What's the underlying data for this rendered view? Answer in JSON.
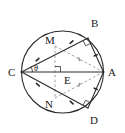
{
  "figure": {
    "kind": "circle-geometry-diagram",
    "background_color": "#ffffff",
    "stroke_color": "#2b2b2b",
    "dashed_stroke_color": "#8a8a8a",
    "label_color": "#1a1a1a",
    "width": 125,
    "height": 133
  },
  "circle": {
    "center_x": 62.5,
    "center_y": 72,
    "radius": 41,
    "stroke_width": 1.1
  },
  "points": [
    {
      "id": "A",
      "label": "A",
      "x": 103.5,
      "y": 72,
      "label_x": 108,
      "label_y": 76
    },
    {
      "id": "B",
      "label": "B",
      "x": 88,
      "y": 38,
      "label_x": 91,
      "label_y": 27
    },
    {
      "id": "C",
      "label": "C",
      "x": 21.5,
      "y": 72,
      "label_x": 8,
      "label_y": 76
    },
    {
      "id": "D",
      "label": "D",
      "x": 88,
      "y": 108,
      "label_x": 90,
      "label_y": 124
    },
    {
      "id": "E",
      "label": "E",
      "x": 62.5,
      "y": 72,
      "label_x": 64,
      "label_y": 84
    },
    {
      "id": "M",
      "label": "M",
      "x": 55,
      "y": 46,
      "label_x": 45,
      "label_y": 44
    },
    {
      "id": "N",
      "label": "N",
      "x": 55,
      "y": 98,
      "label_x": 45,
      "label_y": 108
    }
  ],
  "angle": {
    "label": "θ",
    "vertex": "C",
    "label_x": 34,
    "label_y": 71,
    "arc_radius": 11
  },
  "solid_segments": [
    {
      "name": "segment-CA",
      "from": "C",
      "to": "A"
    },
    {
      "name": "segment-CB",
      "from": "C",
      "to": "B"
    },
    {
      "name": "segment-CD",
      "from": "C",
      "to": "D"
    },
    {
      "name": "segment-AB",
      "from": "A",
      "to": "B"
    },
    {
      "name": "segment-AD",
      "from": "A",
      "to": "D"
    }
  ],
  "dashed_segments": [
    {
      "name": "segment-MA",
      "from": "M",
      "to": "A"
    },
    {
      "name": "segment-NA",
      "from": "N",
      "to": "A"
    },
    {
      "name": "segment-MN",
      "from": "M",
      "to": "N"
    }
  ],
  "right_angle_marks": [
    {
      "name": "right-angle-at-E",
      "at": "E",
      "size": 6
    },
    {
      "name": "right-angle-at-B",
      "at": "B",
      "size": 6
    },
    {
      "name": "right-angle-at-D",
      "at": "D",
      "size": 6
    }
  ],
  "tick_marks": [
    {
      "name": "tick-CM",
      "on": "segment-CM"
    },
    {
      "name": "tick-MB",
      "on": "segment-MB"
    },
    {
      "name": "tick-CN",
      "on": "segment-CN"
    },
    {
      "name": "tick-ND",
      "on": "segment-ND"
    },
    {
      "name": "tick-MA",
      "on": "segment-MA"
    },
    {
      "name": "tick-NA",
      "on": "segment-NA"
    },
    {
      "name": "tick-AB",
      "on": "segment-AB"
    },
    {
      "name": "tick-AD",
      "on": "segment-AD"
    }
  ]
}
